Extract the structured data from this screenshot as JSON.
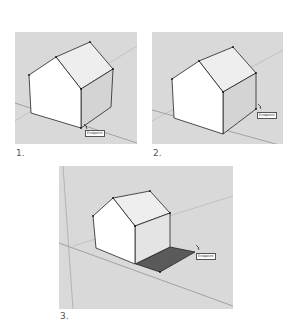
{
  "figure": {
    "panels": [
      {
        "label": "1.",
        "tooltip": "Endpoint"
      },
      {
        "label": "2.",
        "tooltip": "Endpoint"
      },
      {
        "label": "3.",
        "tooltip": "Endpoint"
      }
    ]
  },
  "colors": {
    "viewport_bg": "#d9d9d9",
    "front_face": "#ffffff",
    "roof_face": "#eeeeee",
    "side_face": "#d4d4d4",
    "new_face": "#5a5a5a",
    "edge": "#222222",
    "axis_line": "#a8a8a8"
  }
}
